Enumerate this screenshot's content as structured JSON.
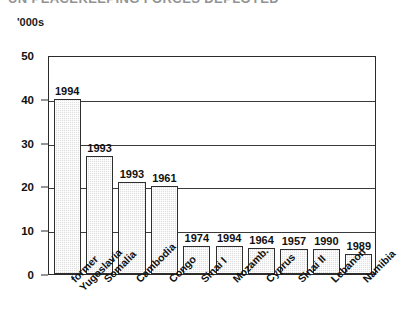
{
  "page": {
    "title_strip": "UN PEACEKEEPING FORCES DEPLOYED",
    "axis_unit": "'000s"
  },
  "chart_data": {
    "type": "bar",
    "title": "",
    "subtitle": "",
    "xlabel": "",
    "ylabel": "'000s",
    "ylim": [
      0,
      50
    ],
    "yticks": [
      0,
      10,
      20,
      30,
      40,
      50
    ],
    "ytick_labels": [
      "0",
      "10",
      "20",
      "30",
      "40",
      "50"
    ],
    "grid": true,
    "gridlines": [
      10,
      20,
      30,
      40
    ],
    "legend": "none",
    "categories": [
      "former Yugoslavia",
      "Somalia",
      "Cambodia",
      "Congo",
      "Sinai I",
      "Mozamb.",
      "Cyprus",
      "Sinai II",
      "Lebanon",
      "Namibia"
    ],
    "category_lines": [
      [
        "former",
        "Yugoslavia"
      ],
      [
        "Somalia"
      ],
      [
        "Cambodia"
      ],
      [
        "Congo"
      ],
      [
        "Sinai I"
      ],
      [
        "Mozamb."
      ],
      [
        "Cyprus"
      ],
      [
        "Sinai II"
      ],
      [
        "Lebanon"
      ],
      [
        "Namibia"
      ]
    ],
    "values": [
      40,
      27,
      21,
      20,
      6.5,
      6.5,
      6,
      5.8,
      5.8,
      4.5
    ],
    "point_labels": [
      "1994",
      "1993",
      "1993",
      "1961",
      "1974",
      "1994",
      "1964",
      "1957",
      "1990",
      "1989"
    ],
    "bar_fill_color": "#dedede",
    "bar_edge_color": "#2f2f2f",
    "axis_color": "#2b2b2b"
  }
}
